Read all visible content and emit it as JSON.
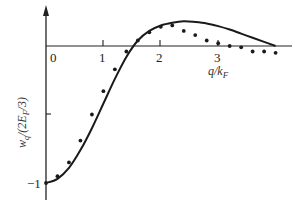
{
  "chart_data": {
    "type": "line",
    "title": "",
    "xlabel": "q/k_F",
    "ylabel": "w_q/(2E_F/3)",
    "x_ticks": [
      "0",
      "1",
      "2",
      "3"
    ],
    "y_ticks": [
      "-1"
    ],
    "xlim": [
      0,
      4.1
    ],
    "ylim": [
      -1.05,
      0.3
    ],
    "grid": false,
    "legend": null,
    "series": [
      {
        "name": "theory curve",
        "style": "solid-line",
        "x": [
          0,
          0.2,
          0.4,
          0.6,
          0.8,
          1.0,
          1.2,
          1.4,
          1.6,
          1.8,
          2.0,
          2.2,
          2.4,
          2.6,
          2.8,
          3.0,
          3.2,
          3.4,
          3.6,
          3.8,
          4.0
        ],
        "y": [
          -1.0,
          -0.97,
          -0.89,
          -0.76,
          -0.6,
          -0.42,
          -0.24,
          -0.08,
          0.04,
          0.11,
          0.15,
          0.17,
          0.18,
          0.175,
          0.165,
          0.145,
          0.12,
          0.09,
          0.06,
          0.03,
          0.0
        ]
      },
      {
        "name": "data points",
        "style": "dots",
        "x": [
          0,
          0.2,
          0.4,
          0.6,
          0.8,
          1.0,
          1.2,
          1.4,
          1.6,
          1.8,
          2.0,
          2.2,
          2.4,
          2.6,
          2.8,
          3.0,
          3.2,
          3.4,
          3.6,
          3.8,
          4.0
        ],
        "y": [
          -1.0,
          -0.95,
          -0.85,
          -0.69,
          -0.5,
          -0.33,
          -0.17,
          -0.04,
          0.04,
          0.1,
          0.14,
          0.15,
          0.11,
          0.08,
          0.04,
          0.02,
          0.0,
          -0.01,
          -0.04,
          -0.04,
          -0.05
        ]
      }
    ]
  },
  "labels": {
    "x0": "0",
    "x1": "1",
    "x2": "2",
    "x3": "3",
    "yminus1": "−1",
    "xlabel": "q/k",
    "xlabel_sub": "F",
    "ylabel": "w",
    "ylabel_sub": "q",
    "ylabel_rest": "/(2E",
    "ylabel_sub2": "F",
    "ylabel_end": "/3)"
  }
}
